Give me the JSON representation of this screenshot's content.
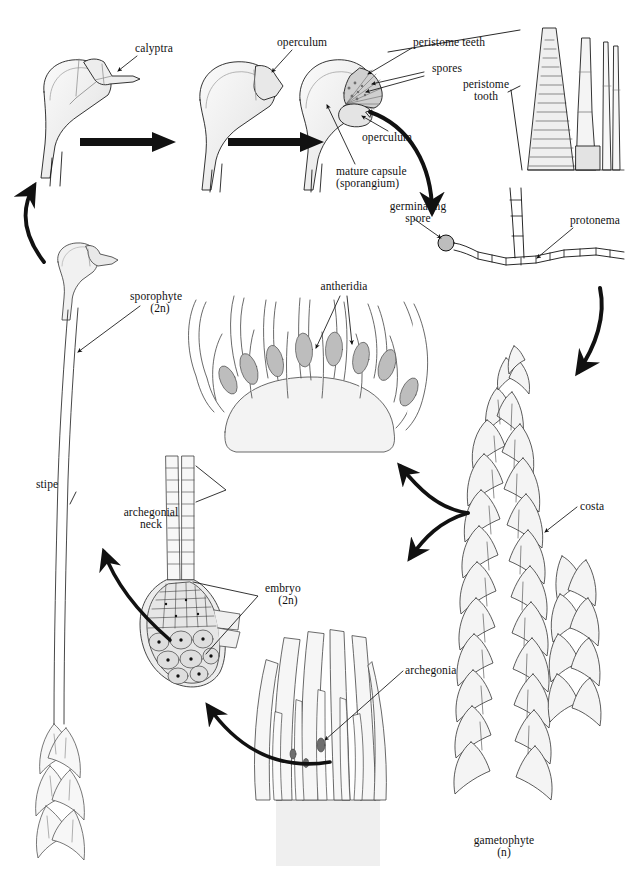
{
  "figure": {
    "background_color": "#ffffff",
    "ink_color": "#111111",
    "fill_light": "#f2f2f2",
    "fill_mid": "#d9d9d9",
    "fill_dark": "#8c8c8c"
  },
  "labels": {
    "calyptra": "calyptra",
    "operculum_top": "operculum",
    "peristome_teeth": "peristome teeth",
    "spores": "spores",
    "peristome_tooth_l1": "peristome",
    "peristome_tooth_l2": "tooth",
    "operculum_mid": "operculum",
    "mature_capsule_l1": "mature capsule",
    "mature_capsule_l2": "(sporangium)",
    "germinating_spore_l1": "germinating",
    "germinating_spore_l2": "spore",
    "protonema": "protonema",
    "antheridia": "antheridia",
    "sporophyte_l1": "sporophyte",
    "sporophyte_l2": "(2n)",
    "stipe": "stipe",
    "archegonial_neck_l1": "archegonial",
    "archegonial_neck_l2": "neck",
    "embryo_l1": "embryo",
    "embryo_l2": "(2n)",
    "archegonia": "archegonia",
    "costa": "costa",
    "gametophyte_l1": "gametophyte",
    "gametophyte_l2": "(n)"
  },
  "stages": [
    {
      "id": "capsule-young",
      "label": "calyptra"
    },
    {
      "id": "capsule-mid",
      "label": "operculum"
    },
    {
      "id": "capsule-mature",
      "label": "mature capsule (sporangium)"
    },
    {
      "id": "peristome-tooth-detail",
      "label": "peristome tooth"
    },
    {
      "id": "germinating-spore",
      "label": "germinating spore"
    },
    {
      "id": "protonema",
      "label": "protonema"
    },
    {
      "id": "gametophyte",
      "label": "gametophyte (n)"
    },
    {
      "id": "antheridial-head",
      "label": "antheridia"
    },
    {
      "id": "archegonial-head",
      "label": "archegonia"
    },
    {
      "id": "embryo",
      "label": "embryo (2n)"
    },
    {
      "id": "sporophyte",
      "label": "sporophyte (2n)"
    }
  ]
}
